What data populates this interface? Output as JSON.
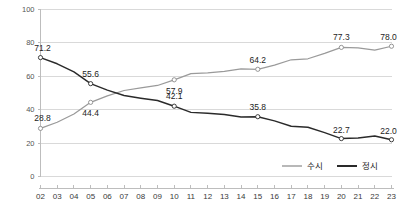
{
  "chart_data": {
    "type": "line",
    "title": "",
    "subtitle": "",
    "xlabel": "",
    "ylabel": "",
    "ylim": [
      0,
      100
    ],
    "yticks": [
      0,
      20,
      40,
      60,
      80,
      100
    ],
    "grid": true,
    "legend_position": "bottom-right",
    "categories": [
      "02",
      "03",
      "04",
      "05",
      "06",
      "07",
      "08",
      "09",
      "10",
      "11",
      "12",
      "13",
      "14",
      "15",
      "16",
      "17",
      "18",
      "19",
      "20",
      "21",
      "22",
      "23"
    ],
    "series": [
      {
        "name": "수시",
        "color": "#9a9a9a",
        "values": [
          28.8,
          32.5,
          37.4,
          44.4,
          48.3,
          51.5,
          53.1,
          54.5,
          57.9,
          61.6,
          62.1,
          62.9,
          64.4,
          64.2,
          66.7,
          69.9,
          70.5,
          73.7,
          77.3,
          77.0,
          75.7,
          78.0
        ],
        "labeled_points": [
          {
            "category": "02",
            "value": 28.8,
            "label": "28.8"
          },
          {
            "category": "05",
            "value": 44.4,
            "label": "44.4"
          },
          {
            "category": "10",
            "value": 57.9,
            "label": "57.9"
          },
          {
            "category": "15",
            "value": 64.2,
            "label": "64.2"
          },
          {
            "category": "20",
            "value": 77.3,
            "label": "77.3"
          },
          {
            "category": "23",
            "value": 78.0,
            "label": "78.0"
          }
        ]
      },
      {
        "name": "정시",
        "color": "#2a2a2a",
        "values": [
          71.2,
          67.5,
          62.6,
          55.6,
          51.7,
          48.5,
          46.9,
          45.5,
          42.1,
          38.4,
          37.9,
          37.1,
          35.6,
          35.8,
          33.3,
          30.1,
          29.5,
          26.3,
          22.7,
          23.0,
          24.3,
          22.0
        ],
        "labeled_points": [
          {
            "category": "02",
            "value": 71.2,
            "label": "71.2"
          },
          {
            "category": "05",
            "value": 55.6,
            "label": "55.6"
          },
          {
            "category": "10",
            "value": 42.1,
            "label": "42.1"
          },
          {
            "category": "15",
            "value": 35.8,
            "label": "35.8"
          },
          {
            "category": "20",
            "value": 22.7,
            "label": "22.7"
          },
          {
            "category": "23",
            "value": 22.0,
            "label": "22.0"
          }
        ]
      }
    ]
  },
  "legend": {
    "items": [
      {
        "label": "수시"
      },
      {
        "label": "정시"
      }
    ]
  },
  "axis": {
    "y_labels": [
      "100",
      "80",
      "60",
      "40",
      "20",
      "0"
    ],
    "x_labels": [
      "02",
      "03",
      "04",
      "05",
      "06",
      "07",
      "08",
      "09",
      "10",
      "11",
      "12",
      "13",
      "14",
      "15",
      "16",
      "17",
      "18",
      "19",
      "20",
      "21",
      "22",
      "23"
    ]
  },
  "colors": {
    "series_a": "#9a9a9a",
    "series_b": "#2a2a2a",
    "grid": "#d9d9d9",
    "axis": "#bdbdbd",
    "background": "#ffffff"
  }
}
